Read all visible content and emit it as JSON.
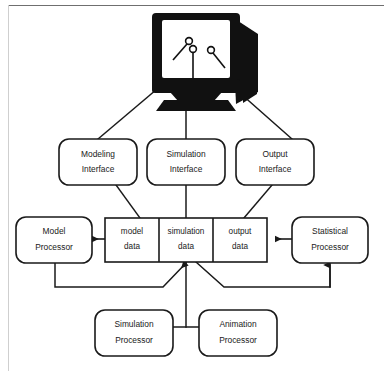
{
  "page": {
    "header_text": "Simulation Sys",
    "stroke_color": "#1a1a1a",
    "fill_color": "#ffffff",
    "monitor_color": "#111111",
    "rule_color": "#6f6f6f"
  },
  "diagram": {
    "monitor": {
      "name": "crt-monitor",
      "pointer_count": 3
    },
    "interfaces": [
      {
        "id": "modeling-interface",
        "line1": "Modeling",
        "line2": "Interface"
      },
      {
        "id": "simulation-interface",
        "line1": "Simulation",
        "line2": "Interface"
      },
      {
        "id": "output-interface",
        "line1": "Output",
        "line2": "Interface"
      }
    ],
    "data_stores": [
      {
        "id": "model-data",
        "line1": "model",
        "line2": "data"
      },
      {
        "id": "simulation-data",
        "line1": "simulation",
        "line2": "data"
      },
      {
        "id": "output-data",
        "line1": "output",
        "line2": "data"
      }
    ],
    "side_processors": [
      {
        "id": "model-processor",
        "line1": "Model",
        "line2": "Processor"
      },
      {
        "id": "statistical-processor",
        "line1": "Statistical",
        "line2": "Processor"
      }
    ],
    "bottom_processors": [
      {
        "id": "simulation-processor",
        "line1": "Simulation",
        "line2": "Processor"
      },
      {
        "id": "animation-processor",
        "line1": "Animation",
        "line2": "Processor"
      }
    ]
  }
}
